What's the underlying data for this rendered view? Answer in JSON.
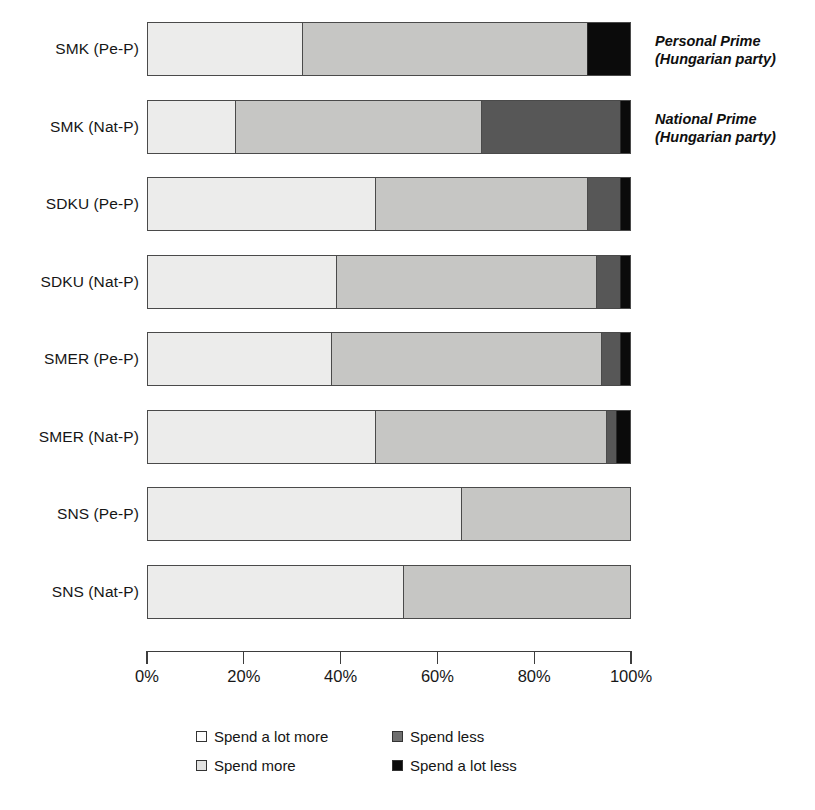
{
  "chart_data": {
    "type": "bar",
    "orientation": "horizontal",
    "stacked": true,
    "normalized": true,
    "title": "",
    "subtitle": "",
    "xlabel": "",
    "ylabel": "",
    "xlim": [
      0,
      100
    ],
    "grid": false,
    "legend_position": "bottom",
    "xtick_labels": [
      "0%",
      "20%",
      "40%",
      "60%",
      "80%",
      "100%"
    ],
    "xtick_values": [
      0,
      20,
      40,
      60,
      80,
      100
    ],
    "categories": [
      "SMK (Pe-P)",
      "SMK (Nat-P)",
      "SDKU (Pe-P)",
      "SDKU (Nat-P)",
      "SMER (Pe-P)",
      "SMER (Nat-P)",
      "SNS (Pe-P)",
      "SNS (Nat-P)"
    ],
    "series": [
      {
        "name": "Spend a lot more",
        "color": "#ececeb",
        "values": [
          32,
          18,
          47,
          39,
          38,
          47,
          65,
          53
        ]
      },
      {
        "name": "Spend more",
        "color": "#c6c6c4",
        "values": [
          59,
          51,
          44,
          54,
          56,
          48,
          35,
          47
        ]
      },
      {
        "name": "Spend less",
        "color": "#575757",
        "values": [
          0,
          29,
          7,
          5,
          4,
          2,
          0,
          0
        ]
      },
      {
        "name": "Spend a lot less",
        "color": "#0b0b0b",
        "values": [
          9,
          2,
          2,
          2,
          2,
          3,
          0,
          0
        ]
      }
    ],
    "annotations": [
      {
        "category": "SMK (Pe-P)",
        "line1": "Personal Prime",
        "line2": "(Hungarian party)"
      },
      {
        "category": "SMK (Nat-P)",
        "line1": "National Prime",
        "line2": "(Hungarian party)"
      }
    ]
  },
  "legend": {
    "entries": [
      {
        "label": "Spend a lot more",
        "swatch": "c0"
      },
      {
        "label": "Spend less",
        "swatch": "c2"
      },
      {
        "label": "Spend more",
        "swatch": "c1"
      },
      {
        "label": "Spend a lot less",
        "swatch": "c3"
      }
    ]
  },
  "caption": {
    "text": ""
  }
}
